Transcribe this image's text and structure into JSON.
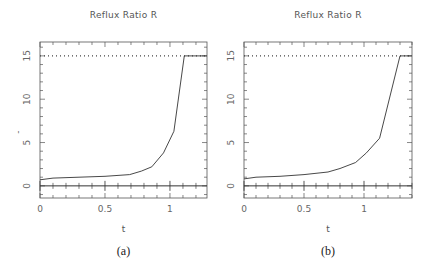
{
  "chart_data": [
    {
      "type": "line",
      "panel": "a",
      "title": "Reflux Ratio R",
      "xlabel": "t",
      "ylabel": "R",
      "caption": "(a)",
      "xlim": [
        0,
        1.285
      ],
      "ylim": [
        -1.4,
        16.6
      ],
      "xticks": [
        0,
        0.5,
        1
      ],
      "xtick_labels": [
        "0",
        "0.5",
        "1"
      ],
      "yticks": [
        0,
        5,
        10,
        15
      ],
      "ytick_labels": [
        "0",
        "5",
        "10",
        "15"
      ],
      "reference_line": {
        "y": 15,
        "style": "dotted"
      },
      "zero_line": {
        "y": 0,
        "style": "solid"
      },
      "series": [
        {
          "name": "R(t)",
          "x": [
            0,
            0.1,
            0.3,
            0.5,
            0.69,
            0.78,
            0.86,
            0.95,
            1.03,
            1.11,
            1.285
          ],
          "y": [
            0.7,
            0.9,
            1.0,
            1.1,
            1.3,
            1.7,
            2.2,
            3.8,
            6.3,
            15,
            15
          ]
        }
      ]
    },
    {
      "type": "line",
      "panel": "b",
      "title": "Reflux Ratio R",
      "xlabel": "t",
      "ylabel": "",
      "caption": "(b)",
      "xlim": [
        0,
        1.4
      ],
      "ylim": [
        -1.4,
        16.6
      ],
      "xticks": [
        0,
        0.5,
        1
      ],
      "xtick_labels": [
        "0",
        "0.5",
        "1"
      ],
      "yticks": [
        0,
        5,
        10,
        15
      ],
      "ytick_labels": [
        "0",
        "5",
        "10",
        "15"
      ],
      "reference_line": {
        "y": 15,
        "style": "dotted"
      },
      "zero_line": {
        "y": 0,
        "style": "solid"
      },
      "series": [
        {
          "name": "R(t)",
          "x": [
            0,
            0.1,
            0.3,
            0.5,
            0.7,
            0.8,
            0.93,
            1.02,
            1.13,
            1.3,
            1.4
          ],
          "y": [
            0.8,
            1.0,
            1.1,
            1.3,
            1.6,
            2.0,
            2.7,
            3.8,
            5.5,
            15,
            15
          ]
        }
      ]
    }
  ]
}
